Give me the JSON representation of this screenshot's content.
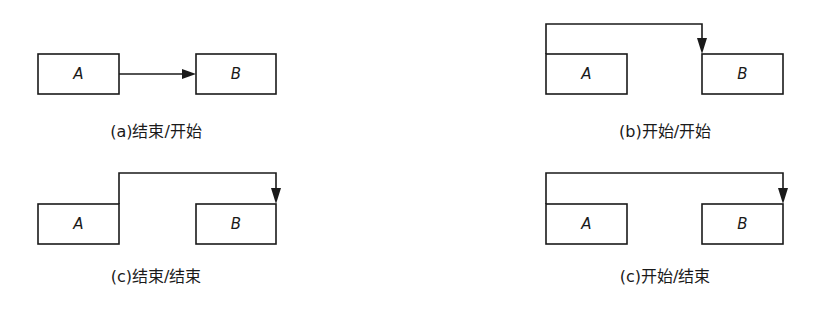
{
  "diagrams": [
    {
      "id": "a",
      "caption": "(a)结束/开始",
      "relation": "finish-to-start",
      "box_a": {
        "label": "A"
      },
      "box_b": {
        "label": "B"
      }
    },
    {
      "id": "b",
      "caption": "(b)开始/开始",
      "relation": "start-to-start",
      "box_a": {
        "label": "A"
      },
      "box_b": {
        "label": "B"
      }
    },
    {
      "id": "c1",
      "caption": "(c)结束/结束",
      "relation": "finish-to-finish",
      "box_a": {
        "label": "A"
      },
      "box_b": {
        "label": "B"
      }
    },
    {
      "id": "c2",
      "caption": "(c)开始/结束",
      "relation": "start-to-finish",
      "box_a": {
        "label": "A"
      },
      "box_b": {
        "label": "B"
      }
    }
  ],
  "colors": {
    "stroke": "#1a1a1a",
    "background": "#ffffff"
  }
}
